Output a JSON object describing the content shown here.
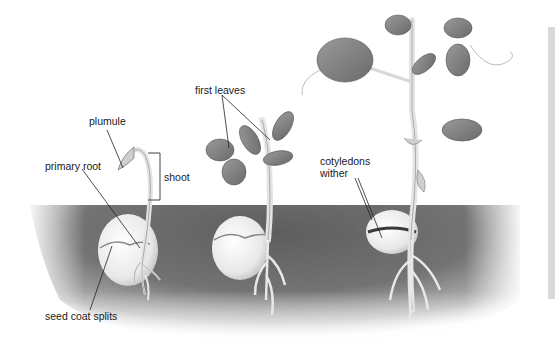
{
  "diagram": {
    "title": "",
    "stages": [
      {
        "name": "stage-1-early-seedling"
      },
      {
        "name": "stage-2-first-leaves"
      },
      {
        "name": "stage-3-mature-seedling"
      }
    ],
    "labels": {
      "plumule": "plumule",
      "primary_root": "primary root",
      "shoot": "shoot",
      "seed_coat_splits": "seed coat splits",
      "first_leaves": "first leaves",
      "cotyledons_line1": "cotyledons",
      "cotyledons_line2": "wither"
    },
    "colors": {
      "soil_dark": "#5e5e5e",
      "soil_light": "#9a9a9a",
      "leaf_dark": "#6f6f6f",
      "leaf_light": "#bdbdbd",
      "stem": "#e6e6e6",
      "seed": "#efefef",
      "label_line": "#222222",
      "side_bar": "#d9d9d9"
    }
  }
}
